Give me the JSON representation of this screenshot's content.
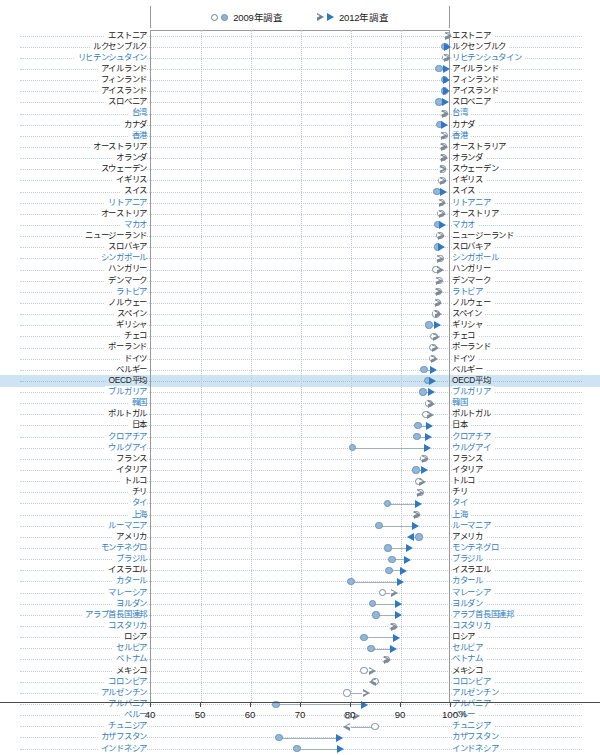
{
  "legend": {
    "items": [
      {
        "label": "2009年調査",
        "markers": [
          "circle-open",
          "circle-filled"
        ]
      },
      {
        "label": "2012年調査",
        "markers": [
          "triangle-open",
          "triangle-filled"
        ]
      }
    ]
  },
  "axis": {
    "ticks": [
      40,
      50,
      60,
      70,
      80,
      90,
      100
    ],
    "unit": "%",
    "min": 40,
    "max": 100
  },
  "colors": {
    "accent_blue": "#2f78c4",
    "marker_fill": "#93b7d8",
    "marker_open_stroke": "#7b8a99",
    "highlight_band": "#cfe4f3",
    "label_blue": "#2f7dc0",
    "label_dark": "#222222",
    "connector": "#9fb0c0"
  },
  "chart_data": {
    "type": "scatter",
    "title": "",
    "subtitle": "",
    "xlabel": "%",
    "ylabel": "",
    "xlim": [
      40,
      100
    ],
    "grid": true,
    "legend_position": "top",
    "series": [
      {
        "name": "2009年調査",
        "marker": "circle"
      },
      {
        "name": "2012年調査",
        "marker": "triangle"
      }
    ],
    "categories": [
      "エストニア",
      "ルクセンブルク",
      "リヒテンシュタイン",
      "アイルランド",
      "フィンランド",
      "アイスランド",
      "スロベニア",
      "台湾",
      "カナダ",
      "香港",
      "オーストラリア",
      "オランダ",
      "スウェーデン",
      "イギリス",
      "スイス",
      "リトアニア",
      "オーストリア",
      "マカオ",
      "ニュージーランド",
      "スロバキア",
      "シンガポール",
      "ハンガリー",
      "デンマーク",
      "ラトビア",
      "ノルウェー",
      "スペイン",
      "ギリシャ",
      "チェコ",
      "ポーランド",
      "ドイツ",
      "ベルギー",
      "OECD平均",
      "ブルガリア",
      "韓国",
      "ポルトガル",
      "日本",
      "クロアチア",
      "ウルグアイ",
      "フランス",
      "イタリア",
      "トルコ",
      "チリ",
      "タイ",
      "上海",
      "ルーマニア",
      "アメリカ",
      "モンテネグロ",
      "ブラジル",
      "イスラエル",
      "カタール",
      "マレーシア",
      "ヨルダン",
      "アラブ首長国連邦",
      "コスタリカ",
      "ロシア",
      "セルビア",
      "ベトナム",
      "メキシコ",
      "コロンビア",
      "アルゼンチン",
      "アルバニア",
      "ペルー",
      "チュニジア",
      "カザフスタン",
      "インドネシア"
    ],
    "rows": [
      {
        "name": "エストニア",
        "v2009": 99.5,
        "v2012": 99.8,
        "f2009": false,
        "f2012": false,
        "hl": false,
        "blue": false
      },
      {
        "name": "ルクセンブルク",
        "v2009": 99.0,
        "v2012": 99.6,
        "f2009": true,
        "f2012": true,
        "hl": false,
        "blue": false
      },
      {
        "name": "リヒテンシュタイン",
        "v2009": 99.2,
        "v2012": 99.6,
        "f2009": false,
        "f2012": false,
        "hl": false,
        "blue": true
      },
      {
        "name": "アイルランド",
        "v2009": 97.8,
        "v2012": 99.4,
        "f2009": true,
        "f2012": true,
        "hl": false,
        "blue": false
      },
      {
        "name": "フィンランド",
        "v2009": 98.9,
        "v2012": 99.4,
        "f2009": true,
        "f2012": true,
        "hl": false,
        "blue": false
      },
      {
        "name": "アイスランド",
        "v2009": 98.9,
        "v2012": 99.3,
        "f2009": true,
        "f2012": true,
        "hl": false,
        "blue": false
      },
      {
        "name": "スロベニア",
        "v2009": 97.8,
        "v2012": 99.2,
        "f2009": true,
        "f2012": true,
        "hl": false,
        "blue": false
      },
      {
        "name": "台湾",
        "v2009": 98.8,
        "v2012": 99.1,
        "f2009": false,
        "f2012": false,
        "hl": false,
        "blue": true
      },
      {
        "name": "カナダ",
        "v2009": 98.0,
        "v2012": 99.0,
        "f2009": true,
        "f2012": true,
        "hl": false,
        "blue": false
      },
      {
        "name": "香港",
        "v2009": 98.8,
        "v2012": 99.0,
        "f2009": false,
        "f2012": false,
        "hl": false,
        "blue": true
      },
      {
        "name": "オーストラリア",
        "v2009": 98.6,
        "v2012": 98.9,
        "f2009": false,
        "f2012": false,
        "hl": false,
        "blue": false
      },
      {
        "name": "オランダ",
        "v2009": 98.6,
        "v2012": 98.9,
        "f2009": false,
        "f2012": false,
        "hl": false,
        "blue": false
      },
      {
        "name": "スウェーデン",
        "v2009": 98.5,
        "v2012": 98.8,
        "f2009": false,
        "f2012": false,
        "hl": false,
        "blue": false
      },
      {
        "name": "イギリス",
        "v2009": 98.4,
        "v2012": 98.8,
        "f2009": false,
        "f2012": false,
        "hl": false,
        "blue": false
      },
      {
        "name": "スイス",
        "v2009": 97.4,
        "v2012": 98.7,
        "f2009": true,
        "f2012": true,
        "hl": false,
        "blue": false
      },
      {
        "name": "リトアニア",
        "v2009": 98.3,
        "v2012": 98.6,
        "f2009": false,
        "f2012": false,
        "hl": false,
        "blue": true
      },
      {
        "name": "オーストリア",
        "v2009": 98.2,
        "v2012": 98.6,
        "f2009": false,
        "f2012": false,
        "hl": false,
        "blue": false
      },
      {
        "name": "マカオ",
        "v2009": 97.6,
        "v2012": 98.5,
        "f2009": true,
        "f2012": true,
        "hl": false,
        "blue": true
      },
      {
        "name": "ニュージーランド",
        "v2009": 98.0,
        "v2012": 98.4,
        "f2009": false,
        "f2012": false,
        "hl": false,
        "blue": false
      },
      {
        "name": "スロバキア",
        "v2009": 97.5,
        "v2012": 98.3,
        "f2009": true,
        "f2012": true,
        "hl": false,
        "blue": false
      },
      {
        "name": "シンガポール",
        "v2009": 98.0,
        "v2012": 98.2,
        "f2009": false,
        "f2012": false,
        "hl": false,
        "blue": true
      },
      {
        "name": "ハンガリー",
        "v2009": 97.2,
        "v2012": 98.1,
        "f2009": false,
        "f2012": false,
        "hl": false,
        "blue": false
      },
      {
        "name": "デンマーク",
        "v2009": 97.8,
        "v2012": 98.0,
        "f2009": false,
        "f2012": false,
        "hl": false,
        "blue": false
      },
      {
        "name": "ラトビア",
        "v2009": 97.6,
        "v2012": 97.9,
        "f2009": false,
        "f2012": false,
        "hl": false,
        "blue": true
      },
      {
        "name": "ノルウェー",
        "v2009": 97.5,
        "v2012": 97.8,
        "f2009": false,
        "f2012": false,
        "hl": false,
        "blue": false
      },
      {
        "name": "スペイン",
        "v2009": 97.2,
        "v2012": 97.7,
        "f2009": false,
        "f2012": false,
        "hl": false,
        "blue": false
      },
      {
        "name": "ギリシャ",
        "v2009": 95.8,
        "v2012": 97.5,
        "f2009": true,
        "f2012": true,
        "hl": false,
        "blue": false
      },
      {
        "name": "チェコ",
        "v2009": 96.8,
        "v2012": 97.4,
        "f2009": false,
        "f2012": false,
        "hl": false,
        "blue": false
      },
      {
        "name": "ポーランド",
        "v2009": 96.6,
        "v2012": 97.2,
        "f2009": false,
        "f2012": false,
        "hl": false,
        "blue": false
      },
      {
        "name": "ドイツ",
        "v2009": 96.5,
        "v2012": 97.0,
        "f2009": false,
        "f2012": false,
        "hl": false,
        "blue": false
      },
      {
        "name": "ベルギー",
        "v2009": 94.8,
        "v2012": 96.8,
        "f2009": true,
        "f2012": true,
        "hl": false,
        "blue": false
      },
      {
        "name": "OECD平均",
        "v2009": 95.5,
        "v2012": 96.6,
        "f2009": true,
        "f2012": true,
        "hl": true,
        "blue": false
      },
      {
        "name": "ブルガリア",
        "v2009": 94.6,
        "v2012": 96.4,
        "f2009": true,
        "f2012": true,
        "hl": false,
        "blue": true
      },
      {
        "name": "韓国",
        "v2009": 95.8,
        "v2012": 96.3,
        "f2009": false,
        "f2012": false,
        "hl": false,
        "blue": true
      },
      {
        "name": "ポルトガル",
        "v2009": 95.2,
        "v2012": 96.1,
        "f2009": false,
        "f2012": false,
        "hl": false,
        "blue": false
      },
      {
        "name": "日本",
        "v2009": 93.6,
        "v2012": 95.9,
        "f2009": true,
        "f2012": true,
        "hl": false,
        "blue": false
      },
      {
        "name": "クロアチア",
        "v2009": 93.4,
        "v2012": 95.7,
        "f2009": true,
        "f2012": true,
        "hl": false,
        "blue": true
      },
      {
        "name": "ウルグアイ",
        "v2009": 80.5,
        "v2012": 95.5,
        "f2009": true,
        "f2012": true,
        "hl": false,
        "blue": true
      },
      {
        "name": "フランス",
        "v2009": 94.8,
        "v2012": 95.2,
        "f2009": false,
        "f2012": false,
        "hl": false,
        "blue": false
      },
      {
        "name": "イタリア",
        "v2009": 93.2,
        "v2012": 95.0,
        "f2009": true,
        "f2012": true,
        "hl": false,
        "blue": false
      },
      {
        "name": "トルコ",
        "v2009": 93.8,
        "v2012": 94.6,
        "f2009": false,
        "f2012": false,
        "hl": false,
        "blue": false
      },
      {
        "name": "チリ",
        "v2009": 94.0,
        "v2012": 94.2,
        "f2009": false,
        "f2012": false,
        "hl": false,
        "blue": false
      },
      {
        "name": "タイ",
        "v2009": 87.5,
        "v2012": 93.8,
        "f2009": true,
        "f2012": true,
        "hl": false,
        "blue": true
      },
      {
        "name": "上海",
        "v2009": 93.2,
        "v2012": 93.5,
        "f2009": false,
        "f2012": false,
        "hl": false,
        "blue": true
      },
      {
        "name": "ルーマニア",
        "v2009": 85.8,
        "v2012": 93.2,
        "f2009": true,
        "f2012": true,
        "hl": false,
        "blue": true
      },
      {
        "name": "アメリカ",
        "v2009": 93.8,
        "v2012": 92.2,
        "f2009": true,
        "f2012": true,
        "hl": false,
        "blue": false,
        "rev": true
      },
      {
        "name": "モンテネグロ",
        "v2009": 87.6,
        "v2012": 92.0,
        "f2009": true,
        "f2012": true,
        "hl": false,
        "blue": true
      },
      {
        "name": "ブラジル",
        "v2009": 88.4,
        "v2012": 91.5,
        "f2009": true,
        "f2012": true,
        "hl": false,
        "blue": true
      },
      {
        "name": "イスラエル",
        "v2009": 87.8,
        "v2012": 90.8,
        "f2009": true,
        "f2012": true,
        "hl": false,
        "blue": false
      },
      {
        "name": "カタール",
        "v2009": 80.2,
        "v2012": 90.2,
        "f2009": true,
        "f2012": true,
        "hl": false,
        "blue": true
      },
      {
        "name": "マレーシア",
        "v2009": 86.5,
        "v2012": 89.0,
        "f2009": false,
        "f2012": false,
        "hl": false,
        "blue": true
      },
      {
        "name": "ヨルダン",
        "v2009": 84.5,
        "v2012": 89.8,
        "f2009": true,
        "f2012": true,
        "hl": false,
        "blue": true
      },
      {
        "name": "アラブ首長国連邦",
        "v2009": 85.2,
        "v2012": 89.8,
        "f2009": true,
        "f2012": true,
        "hl": false,
        "blue": true
      },
      {
        "name": "コスタリカ",
        "v2009": 88.6,
        "v2012": 88.9,
        "f2009": false,
        "f2012": false,
        "hl": false,
        "blue": true
      },
      {
        "name": "ロシア",
        "v2009": 82.8,
        "v2012": 89.4,
        "f2009": true,
        "f2012": true,
        "hl": false,
        "blue": false
      },
      {
        "name": "セルビア",
        "v2009": 84.2,
        "v2012": 88.8,
        "f2009": true,
        "f2012": true,
        "hl": false,
        "blue": true
      },
      {
        "name": "ベトナム",
        "v2009": 87.2,
        "v2012": 87.5,
        "f2009": false,
        "f2012": false,
        "hl": false,
        "blue": true
      },
      {
        "name": "メキシコ",
        "v2009": 82.8,
        "v2012": 84.6,
        "f2009": false,
        "f2012": false,
        "hl": false,
        "blue": false
      },
      {
        "name": "コロンビア",
        "v2009": 85.0,
        "v2012": 84.5,
        "f2009": false,
        "f2012": false,
        "hl": false,
        "blue": true,
        "rev": true
      },
      {
        "name": "アルゼンチン",
        "v2009": 79.4,
        "v2012": 83.4,
        "f2009": false,
        "f2012": false,
        "hl": false,
        "blue": true
      },
      {
        "name": "アルバニア",
        "v2009": 65.2,
        "v2012": 83.0,
        "f2009": true,
        "f2012": true,
        "hl": false,
        "blue": true
      },
      {
        "name": "ペルー",
        "v2009": 79.6,
        "v2012": 81.4,
        "f2009": false,
        "f2012": false,
        "hl": false,
        "blue": true
      },
      {
        "name": "チュニジア",
        "v2009": 85.0,
        "v2012": 79.4,
        "f2009": false,
        "f2012": false,
        "hl": false,
        "blue": true,
        "rev": true
      },
      {
        "name": "カザフスタン",
        "v2009": 65.8,
        "v2012": 78.0,
        "f2009": true,
        "f2012": true,
        "hl": false,
        "blue": true
      },
      {
        "name": "インドネシア",
        "v2009": 69.4,
        "v2012": 78.2,
        "f2009": true,
        "f2012": true,
        "hl": false,
        "blue": true
      }
    ]
  }
}
